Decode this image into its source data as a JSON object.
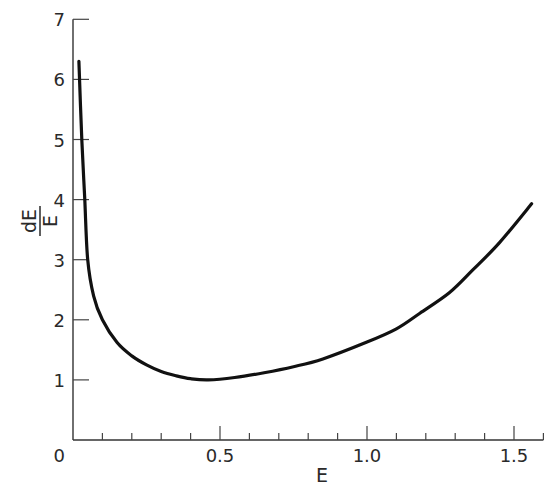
{
  "chart_data": {
    "type": "line",
    "title": "",
    "xlabel": "E",
    "ylabel": "dE/E",
    "ylabel_parts": {
      "numerator": "dE",
      "denominator": "E"
    },
    "xlim": [
      0,
      1.6
    ],
    "ylim": [
      0,
      7
    ],
    "grid": false,
    "legend": null,
    "x_ticks_major": [
      0,
      0.5,
      1.0,
      1.5
    ],
    "x_tick_labels": [
      "0",
      "0.5",
      "1.0",
      "1.5"
    ],
    "x_ticks_minor_step": 0.1,
    "y_ticks": [
      1,
      2,
      3,
      4,
      5,
      6,
      7
    ],
    "y_tick_labels": [
      "1",
      "2",
      "3",
      "4",
      "5",
      "6",
      "7"
    ],
    "series": [
      {
        "name": "dE/E",
        "color": "#111111",
        "x": [
          0.02,
          0.03,
          0.04,
          0.05,
          0.07,
          0.1,
          0.15,
          0.2,
          0.25,
          0.3,
          0.35,
          0.4,
          0.46,
          0.55,
          0.65,
          0.75,
          0.85,
          1.0,
          1.1,
          1.18,
          1.28,
          1.36,
          1.45,
          1.56
        ],
        "y": [
          6.3,
          5.0,
          4.0,
          3.0,
          2.4,
          2.0,
          1.62,
          1.4,
          1.25,
          1.14,
          1.07,
          1.02,
          1.0,
          1.04,
          1.12,
          1.22,
          1.35,
          1.63,
          1.85,
          2.11,
          2.45,
          2.83,
          3.28,
          3.93
        ]
      }
    ]
  }
}
